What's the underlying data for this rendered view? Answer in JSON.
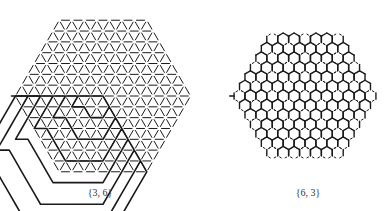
{
  "figures": [
    {
      "id": "tri",
      "label": "{3, 6}",
      "label_pos": [
        70,
        187
      ],
      "type": "triangular-tessellation-spiral",
      "center": [
        103,
        96
      ],
      "edge": 12.5,
      "rings": 7
    },
    {
      "id": "hex",
      "label": "{6, 3}",
      "label_pos": [
        278,
        187
      ],
      "type": "hexagonal-tessellation-spiral",
      "center": [
        305,
        96
      ],
      "edge": 6.3,
      "rings": 6
    }
  ],
  "colors": {
    "ink": "#1a1a1a",
    "paper": "#ffffff"
  }
}
